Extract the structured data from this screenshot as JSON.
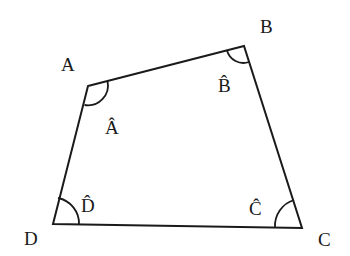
{
  "diagram": {
    "type": "quadrilateral",
    "stroke_color": "#1a1a1a",
    "vertices": [
      {
        "name": "A",
        "label": "A",
        "angle_label": "Â"
      },
      {
        "name": "B",
        "label": "B",
        "angle_label": "B̂"
      },
      {
        "name": "C",
        "label": "C",
        "angle_label": "Ĉ"
      },
      {
        "name": "D",
        "label": "D",
        "angle_label": "D̂"
      }
    ]
  }
}
